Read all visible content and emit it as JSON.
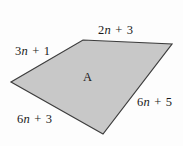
{
  "figure": {
    "type": "quadrilateral-diagram",
    "background_color": "#fdfdfd",
    "shape": {
      "name": "A",
      "fill_color": "#c8c8c8",
      "stroke_color": "#3d3d3d",
      "stroke_width": 1.2,
      "vertices": [
        {
          "name": "top-left",
          "x": 83,
          "y": 40
        },
        {
          "name": "top-right",
          "x": 172,
          "y": 44
        },
        {
          "name": "bottom",
          "x": 103,
          "y": 134
        },
        {
          "name": "left",
          "x": 11,
          "y": 82
        }
      ],
      "interior_label": "A"
    },
    "side_labels": [
      {
        "id": "top",
        "position": "top",
        "coefficient": "2",
        "variable": "n",
        "operator": "+",
        "constant": "3",
        "text": "2n + 3"
      },
      {
        "id": "left",
        "position": "upper-left",
        "coefficient": "3",
        "variable": "n",
        "operator": "+",
        "constant": "1",
        "text": "3n + 1"
      },
      {
        "id": "right",
        "position": "lower-right",
        "coefficient": "6",
        "variable": "n",
        "operator": "+",
        "constant": "5",
        "text": "6n + 5"
      },
      {
        "id": "bottom",
        "position": "lower-left",
        "coefficient": "6",
        "variable": "n",
        "operator": "+",
        "constant": "3",
        "text": "6n + 3"
      }
    ]
  }
}
